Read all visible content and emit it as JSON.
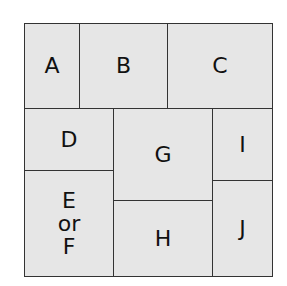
{
  "diagram": {
    "type": "partition-grid",
    "colors": {
      "fill": "#e6e6e6",
      "border": "#333333",
      "text": "#111111",
      "background": "#ffffff"
    },
    "cells": [
      {
        "id": "A",
        "label": "A",
        "x": 24,
        "y": 23,
        "w": 56,
        "h": 86
      },
      {
        "id": "B",
        "label": "B",
        "x": 79,
        "y": 23,
        "w": 89,
        "h": 86
      },
      {
        "id": "C",
        "label": "C",
        "x": 167,
        "y": 23,
        "w": 106,
        "h": 86
      },
      {
        "id": "D",
        "label": "D",
        "x": 24,
        "y": 108,
        "w": 90,
        "h": 63
      },
      {
        "id": "G",
        "label": "G",
        "x": 113,
        "y": 108,
        "w": 100,
        "h": 93
      },
      {
        "id": "I",
        "label": "I",
        "x": 212,
        "y": 108,
        "w": 61,
        "h": 73
      },
      {
        "id": "EF",
        "label": "E\nor\nF",
        "x": 24,
        "y": 170,
        "w": 90,
        "h": 107
      },
      {
        "id": "H",
        "label": "H",
        "x": 113,
        "y": 200,
        "w": 100,
        "h": 77
      },
      {
        "id": "J",
        "label": "J",
        "x": 212,
        "y": 180,
        "w": 61,
        "h": 97
      }
    ]
  }
}
